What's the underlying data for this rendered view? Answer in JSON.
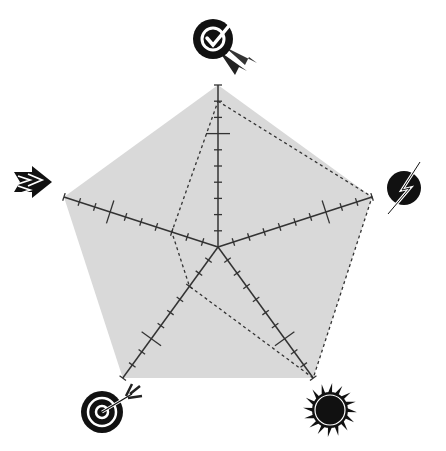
{
  "chart_data": {
    "type": "radar",
    "title": "",
    "axes": [
      {
        "name": "quality-award",
        "icon": "badge-checkmark-icon"
      },
      {
        "name": "energy",
        "icon": "lightning-circle-icon"
      },
      {
        "name": "sun",
        "icon": "sun-icon"
      },
      {
        "name": "target",
        "icon": "target-arrow-icon"
      },
      {
        "name": "direction",
        "icon": "arrows-right-icon"
      }
    ],
    "scale": {
      "min": 0,
      "max": 10,
      "ticks": 10,
      "major_tick": 7
    },
    "series": [
      {
        "name": "maximum",
        "values": [
          10,
          10,
          10,
          10,
          10
        ],
        "style": "filled",
        "fill": "#d9d9d9"
      },
      {
        "name": "score",
        "values": [
          9,
          10,
          10,
          3,
          3
        ],
        "style": "dashed",
        "stroke": "#333333"
      }
    ],
    "grid": false,
    "legend": "none"
  },
  "colors": {
    "fill": "#d9d9d9",
    "axis": "#333333",
    "dashed": "#333333",
    "icon": "#111111"
  }
}
